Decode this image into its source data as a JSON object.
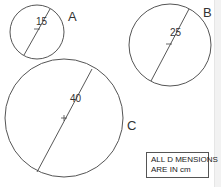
{
  "circles": [
    {
      "label": "A",
      "diameter": "15",
      "cx": 37,
      "cy": 32,
      "r": 27
    },
    {
      "label": "B",
      "diameter": "25",
      "cx": 170,
      "cy": 45,
      "r": 41
    },
    {
      "label": "C",
      "diameter": "40",
      "cx": 64,
      "cy": 118,
      "r": 59
    }
  ],
  "note": {
    "line1": "ALL D MENSIONS",
    "line2": "ARE IN cm"
  },
  "colors": {
    "stroke": "#555555",
    "text": "#333333"
  }
}
